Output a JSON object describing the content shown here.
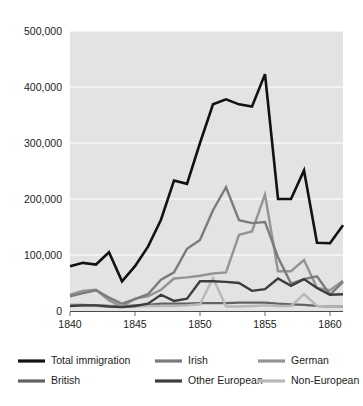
{
  "chart_data": {
    "type": "line",
    "title": "",
    "subtitle": "",
    "xlabel": "",
    "ylabel": "",
    "xlim": [
      1840,
      1861
    ],
    "ylim": [
      0,
      500000
    ],
    "grid": "horizontal",
    "legend_position": "bottom",
    "plot_background": "#e3e3e3",
    "x": [
      1840,
      1841,
      1842,
      1843,
      1844,
      1845,
      1846,
      1847,
      1848,
      1849,
      1850,
      1851,
      1852,
      1853,
      1854,
      1855,
      1856,
      1857,
      1858,
      1859,
      1860,
      1861
    ],
    "xticks": [
      1840,
      1845,
      1850,
      1855,
      1860
    ],
    "xtick_labels": [
      "1840",
      "1845",
      "1850",
      "1855",
      "1860"
    ],
    "yticks": [
      0,
      100000,
      200000,
      300000,
      400000,
      500000
    ],
    "ytick_labels": [
      "0",
      "100,000",
      "200,000",
      "300,000",
      "400,000",
      "500,000"
    ],
    "series": [
      {
        "name": "Total immigration",
        "color": "#121212",
        "width": 2.6,
        "values": [
          80000,
          86000,
          83000,
          105000,
          53000,
          80000,
          115000,
          163000,
          233000,
          227000,
          300000,
          369000,
          378000,
          369000,
          365000,
          423000,
          200000,
          200000,
          251000,
          122000,
          121000,
          153000
        ]
      },
      {
        "name": "Irish",
        "color": "#7b7b7b",
        "width": 2.4,
        "values": [
          26000,
          32000,
          37000,
          24000,
          13000,
          21000,
          30000,
          56000,
          69000,
          111000,
          127000,
          180000,
          221000,
          162000,
          157000,
          159000,
          96000,
          49000,
          57000,
          62000,
          29000,
          52000
        ]
      },
      {
        "name": "German",
        "color": "#949494",
        "width": 2.4,
        "values": [
          29000,
          36000,
          38000,
          19000,
          8000,
          22000,
          26000,
          38000,
          58000,
          60000,
          63000,
          67000,
          69000,
          136000,
          142000,
          208000,
          71000,
          71000,
          91000,
          41000,
          37000,
          54000
        ]
      },
      {
        "name": "British",
        "color": "#636363",
        "width": 2.3,
        "values": [
          11000,
          11000,
          10000,
          9000,
          8000,
          10000,
          11000,
          13000,
          13000,
          13000,
          14000,
          14000,
          14000,
          15000,
          15000,
          15000,
          13000,
          12000,
          11000,
          9000,
          8000,
          8000
        ]
      },
      {
        "name": "Other European",
        "color": "#3d3d3d",
        "width": 2.4,
        "values": [
          9000,
          10000,
          10000,
          8000,
          7000,
          9000,
          13000,
          29000,
          18000,
          22000,
          53000,
          53000,
          52000,
          50000,
          36000,
          39000,
          58000,
          45000,
          57000,
          41000,
          29000,
          30000
        ]
      },
      {
        "name": "Non-European",
        "color": "#b8b8b8",
        "width": 2.4,
        "values": [
          10000,
          9000,
          9000,
          8000,
          7000,
          8000,
          9000,
          9000,
          9000,
          10000,
          12000,
          59000,
          8000,
          8000,
          9000,
          10000,
          9000,
          9000,
          30000,
          9000,
          8000,
          8000
        ]
      }
    ]
  },
  "legend": {
    "items": [
      {
        "label": "Total immigration",
        "color": "#121212"
      },
      {
        "label": "Irish",
        "color": "#7b7b7b"
      },
      {
        "label": "German",
        "color": "#949494"
      },
      {
        "label": "British",
        "color": "#636363"
      },
      {
        "label": "Other European",
        "color": "#3d3d3d"
      },
      {
        "label": "Non-European",
        "color": "#b8b8b8"
      }
    ]
  }
}
